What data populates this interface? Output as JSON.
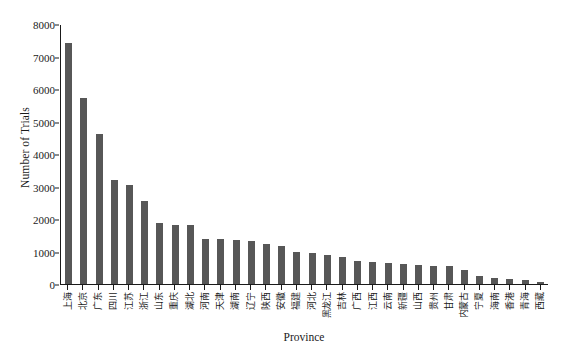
{
  "chart_data": {
    "type": "bar",
    "title": "",
    "xlabel": "Province",
    "ylabel": "Number of Trials",
    "ylim": [
      0,
      8000
    ],
    "ytick_labels": [
      "0",
      "1000",
      "2000",
      "3000",
      "4000",
      "5000",
      "6000",
      "7000",
      "8000"
    ],
    "ytick_values": [
      0,
      1000,
      2000,
      3000,
      4000,
      5000,
      6000,
      7000,
      8000
    ],
    "grid": false,
    "legend": "none",
    "bar_color": "#575757",
    "categories": [
      "上海",
      "北京",
      "广东",
      "四川",
      "江苏",
      "浙江",
      "山东",
      "重庆",
      "湖北",
      "河南",
      "天津",
      "湖南",
      "辽宁",
      "陕西",
      "安徽",
      "福建",
      "河北",
      "黑龙江",
      "吉林",
      "广西",
      "江西",
      "云南",
      "新疆",
      "山西",
      "贵州",
      "甘肃",
      "内蒙古",
      "宁夏",
      "海南",
      "香港",
      "青海",
      "西藏"
    ],
    "values": [
      7430,
      5720,
      4620,
      3210,
      3060,
      2550,
      1870,
      1820,
      1830,
      1400,
      1380,
      1340,
      1320,
      1220,
      1160,
      1000,
      960,
      900,
      840,
      700,
      680,
      660,
      620,
      600,
      560,
      540,
      420,
      250,
      170,
      150,
      110,
      60
    ]
  },
  "axes": {
    "x_title": "Province",
    "y_title": "Number of Trials"
  }
}
